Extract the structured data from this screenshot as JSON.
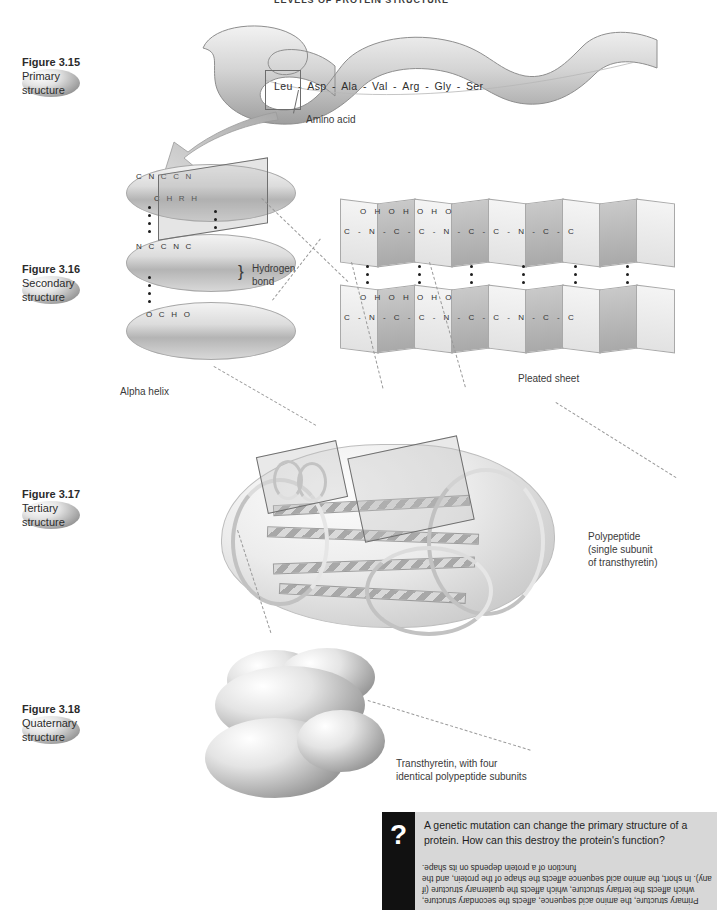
{
  "page": {
    "header": "LEVELS OF PROTEIN STRUCTURE"
  },
  "figures": [
    {
      "number": "Figure 3.15",
      "title": "Primary structure"
    },
    {
      "number": "Figure 3.16",
      "title": "Secondary structure"
    },
    {
      "number": "Figure 3.17",
      "title": "Tertiary structure"
    },
    {
      "number": "Figure 3.18",
      "title": "Quaternary structure"
    }
  ],
  "primary": {
    "sequence": [
      "Leu",
      "Asp",
      "Ala",
      "Val",
      "Arg",
      "Gly",
      "Ser"
    ],
    "separator": "-",
    "callout": "Amino acid"
  },
  "secondary": {
    "helix_label": "Alpha helix",
    "sheet_label": "Pleated sheet",
    "hydrogen_bond_label_line1": "Hydrogen",
    "hydrogen_bond_label_line2": "bond",
    "helix_atoms": {
      "row1": "C  N  C  C  N",
      "row2": "C  H  R  H",
      "row3": "N  C  C  N  C",
      "row4": "O  C  H  O"
    },
    "sheet_atoms": {
      "row1": "C - N - C - C - N - C - C - N - C - C",
      "row2": "O   H   O   H   O   H   O"
    }
  },
  "tertiary": {
    "callout_line1": "Polypeptide",
    "callout_line2": "(single subunit",
    "callout_line3": "of transthyretin)"
  },
  "quaternary": {
    "callout_line1": "Transthyretin, with four",
    "callout_line2": "identical polypeptide subunits"
  },
  "question": {
    "badge": "?",
    "text": "A genetic mutation can change the primary structure of a protein. How can this destroy the protein's function?",
    "answer": "Primary structure, the amino acid sequence, affects the secondary structure, which affects the tertiary structure, which affects the quaternary structure (if any). In short, the amino acid sequence affects the shape of the protein, and the function of a protein depends on its shape."
  },
  "colors": {
    "panel_gray": "#d7d7d7",
    "badge_black": "#111111",
    "text": "#2b2b2b",
    "dash_line": "#9a9a9a"
  }
}
